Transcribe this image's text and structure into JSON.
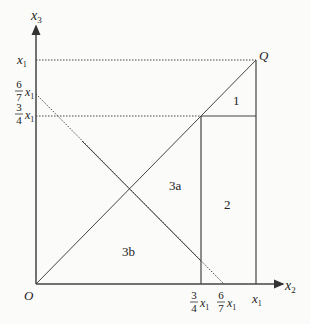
{
  "axes": {
    "x_label": "x",
    "x_sub": "2",
    "y_label": "x",
    "y_sub": "3",
    "origin": "O",
    "corner_point": "Q"
  },
  "x_ticks": [
    {
      "num": "3",
      "den": "4",
      "var": "x",
      "sub": "1"
    },
    {
      "num": "6",
      "den": "7",
      "var": "x",
      "sub": "1"
    },
    {
      "var": "x",
      "sub": "1"
    }
  ],
  "y_ticks": [
    {
      "var": "x",
      "sub": "1"
    },
    {
      "num": "6",
      "den": "7",
      "var": "x",
      "sub": "1"
    },
    {
      "num": "3",
      "den": "4",
      "var": "x",
      "sub": "1"
    }
  ],
  "regions": [
    "1",
    "2",
    "3a",
    "3b"
  ],
  "colors": {
    "line": "#333333",
    "background": "#fbfbf9"
  }
}
